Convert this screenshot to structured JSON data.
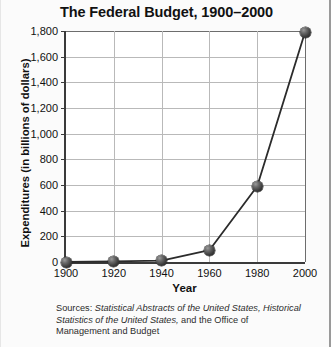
{
  "chart_data": {
    "type": "line",
    "title": "The Federal Budget, 1900–2000",
    "xlabel": "Year",
    "ylabel": "Expenditures (in billions of dollars)",
    "x": [
      1900,
      1920,
      1940,
      1960,
      1980,
      2000
    ],
    "xtick_labels": [
      "1900",
      "1920",
      "1940",
      "1960",
      "1980",
      "2000"
    ],
    "values": [
      0,
      5,
      10,
      92,
      590,
      1790
    ],
    "ytick_labels": [
      "0",
      "200",
      "400",
      "600",
      "800",
      "1,000",
      "1,200",
      "1,400",
      "1,600",
      "1,800"
    ],
    "ytick_values": [
      0,
      200,
      400,
      600,
      800,
      1000,
      1200,
      1400,
      1600,
      1800
    ],
    "ylim": [
      0,
      1800
    ],
    "xlim": [
      1900,
      2000
    ],
    "grid": true,
    "legend": "none",
    "series_color": "#2b2b2b",
    "marker_color": "#333333",
    "grid_color": "#b9b9b9",
    "axis_color": "#3a3a3a",
    "plot_background": "#ffffff"
  },
  "source_note": {
    "prefix": "Sources: ",
    "work_one": "Statistical Abstracts of the United States,",
    "middle": " ",
    "work_two": "Historical Statistics of the United States,",
    "suffix": " and the Office of Management and Budget"
  }
}
